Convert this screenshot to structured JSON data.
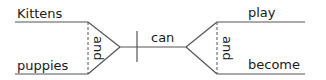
{
  "diagram": {
    "type": "sentence-diagram",
    "subjects": [
      "Kittens",
      "puppies"
    ],
    "subject_conjunction": "and",
    "auxiliary": "can",
    "verbs": [
      "play",
      "become"
    ],
    "verb_conjunction": "and",
    "line_color": "#555555",
    "text_color": "#1a1a1a"
  }
}
